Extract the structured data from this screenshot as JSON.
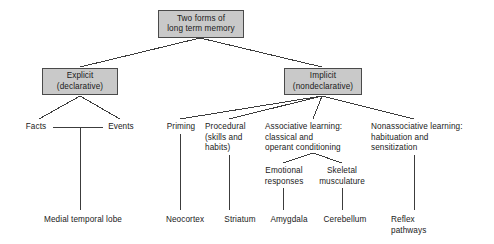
{
  "diagram": {
    "title_box": {
      "id": "two-forms-long-term-memory",
      "text": "Two forms of\nlong term memory",
      "x": 158,
      "y": 10,
      "w": 86,
      "h": 28
    },
    "category_boxes": [
      {
        "id": "explicit-declarative",
        "text": "Explicit\n(declarative)",
        "x": 42,
        "y": 68,
        "w": 76,
        "h": 27
      },
      {
        "id": "implicit-nondeclarative",
        "text": "Implicit\n(nondeclarative)",
        "x": 284,
        "y": 68,
        "w": 78,
        "h": 27
      }
    ],
    "labels": [
      {
        "id": "facts",
        "text": "Facts",
        "x": 21,
        "y": 122,
        "w": 30,
        "align": "center"
      },
      {
        "id": "events",
        "text": "Events",
        "x": 103,
        "y": 122,
        "w": 36,
        "align": "center"
      },
      {
        "id": "priming",
        "text": "Priming",
        "x": 163,
        "y": 122,
        "w": 36,
        "align": "center"
      },
      {
        "id": "procedural-skills-and-habits",
        "text": "Procedural\n(skills and\nhabits)",
        "x": 205,
        "y": 122,
        "w": 50,
        "align": "left"
      },
      {
        "id": "associative-learning",
        "text": "Associative learning:\nclassical and\noperant conditioning",
        "x": 265,
        "y": 122,
        "w": 96,
        "align": "left"
      },
      {
        "id": "nonassociative-learning",
        "text": "Nonassociative learning:\nhabituation and\nsensitization",
        "x": 371,
        "y": 122,
        "w": 112,
        "align": "left"
      },
      {
        "id": "emotional-responses",
        "text": "Emotional\nresponses",
        "x": 259,
        "y": 166,
        "w": 50,
        "align": "center"
      },
      {
        "id": "skeletal-musculature",
        "text": "Skeletal\nmusculature",
        "x": 311,
        "y": 166,
        "w": 62,
        "align": "center"
      },
      {
        "id": "medial-temporal-lobe",
        "text": "Medial temporal lobe",
        "x": 34,
        "y": 215,
        "w": 98,
        "align": "center"
      },
      {
        "id": "neocortex",
        "text": "Neocortex",
        "x": 161,
        "y": 215,
        "w": 48,
        "align": "center"
      },
      {
        "id": "striatum",
        "text": "Striatum",
        "x": 219,
        "y": 215,
        "w": 42,
        "align": "center"
      },
      {
        "id": "amygdala",
        "text": "Amygdala",
        "x": 264,
        "y": 215,
        "w": 50,
        "align": "center"
      },
      {
        "id": "cerebellum",
        "text": "Cerebellum",
        "x": 318,
        "y": 215,
        "w": 54,
        "align": "center"
      },
      {
        "id": "reflex-pathways",
        "text": "Reflex\npathways",
        "x": 391,
        "y": 215,
        "w": 44,
        "align": "left"
      }
    ],
    "edges": [
      {
        "id": "root-to-explicit",
        "x1": 200,
        "y1": 38,
        "x2": 80,
        "y2": 67
      },
      {
        "id": "root-to-implicit",
        "x1": 200,
        "y1": 38,
        "x2": 322,
        "y2": 67
      },
      {
        "id": "explicit-to-facts",
        "x1": 80,
        "y1": 96,
        "x2": 39,
        "y2": 119
      },
      {
        "id": "explicit-to-events",
        "x1": 80,
        "y1": 96,
        "x2": 120,
        "y2": 119
      },
      {
        "id": "facts-events-connector",
        "x1": 53,
        "y1": 127,
        "x2": 103,
        "y2": 127
      },
      {
        "id": "explicit-stem-to-medial-temporal-lobe",
        "x1": 80,
        "y1": 127,
        "x2": 80,
        "y2": 210
      },
      {
        "id": "implicit-to-priming",
        "x1": 322,
        "y1": 96,
        "x2": 180,
        "y2": 119
      },
      {
        "id": "implicit-to-procedural",
        "x1": 322,
        "y1": 96,
        "x2": 229,
        "y2": 119
      },
      {
        "id": "implicit-to-associative",
        "x1": 322,
        "y1": 96,
        "x2": 313,
        "y2": 119
      },
      {
        "id": "implicit-to-nonassociative",
        "x1": 322,
        "y1": 96,
        "x2": 414,
        "y2": 119
      },
      {
        "id": "priming-to-neocortex",
        "x1": 180,
        "y1": 134,
        "x2": 180,
        "y2": 210
      },
      {
        "id": "procedural-to-striatum",
        "x1": 229,
        "y1": 155,
        "x2": 229,
        "y2": 210
      },
      {
        "id": "associative-to-emotional",
        "x1": 313,
        "y1": 153,
        "x2": 283,
        "y2": 163
      },
      {
        "id": "associative-to-skeletal",
        "x1": 313,
        "y1": 153,
        "x2": 342,
        "y2": 163
      },
      {
        "id": "emotional-to-amygdala",
        "x1": 283,
        "y1": 188,
        "x2": 283,
        "y2": 210
      },
      {
        "id": "skeletal-to-cerebellum",
        "x1": 342,
        "y1": 188,
        "x2": 342,
        "y2": 210
      },
      {
        "id": "nonassociative-to-reflex",
        "x1": 414,
        "y1": 155,
        "x2": 414,
        "y2": 210
      }
    ],
    "style": {
      "box_fill": "#c9c9c9",
      "box_stroke": "#4a4a4a",
      "edge_stroke": "#3c3c3c",
      "text_color": "#1a1a1a",
      "background": "#ffffff"
    }
  }
}
